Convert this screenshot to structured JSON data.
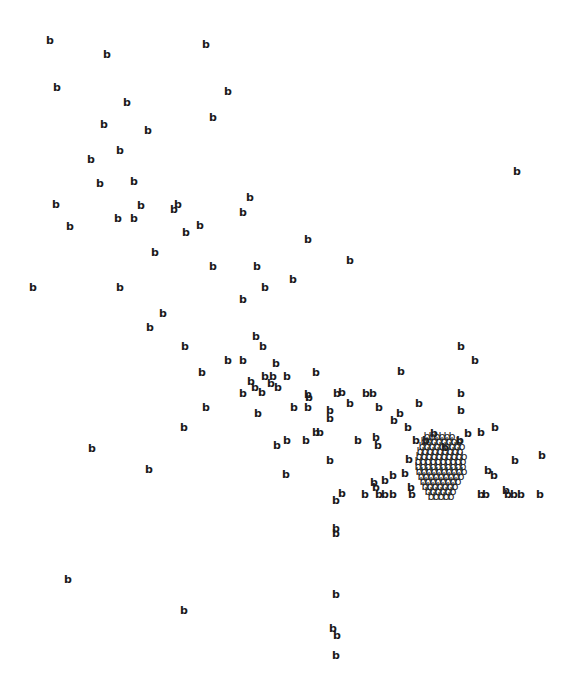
{
  "chart_data": {
    "type": "scatter",
    "marker_glyph": "b",
    "xlabel": "",
    "ylabel": "",
    "axes_visible": false,
    "grid": false,
    "legend": null,
    "coordinate_space": "pixel coordinates of a 571x687 image, origin top-left",
    "points": [
      [
        50,
        40
      ],
      [
        107,
        54
      ],
      [
        206,
        44
      ],
      [
        57,
        87
      ],
      [
        127,
        102
      ],
      [
        228,
        91
      ],
      [
        104,
        124
      ],
      [
        148,
        130
      ],
      [
        213,
        117
      ],
      [
        91,
        159
      ],
      [
        120,
        150
      ],
      [
        100,
        183
      ],
      [
        134,
        181
      ],
      [
        517,
        171
      ],
      [
        56,
        204
      ],
      [
        70,
        226
      ],
      [
        118,
        218
      ],
      [
        134,
        218
      ],
      [
        141,
        205
      ],
      [
        174,
        209
      ],
      [
        178,
        204
      ],
      [
        186,
        232
      ],
      [
        200,
        225
      ],
      [
        243,
        212
      ],
      [
        250,
        197
      ],
      [
        155,
        252
      ],
      [
        213,
        266
      ],
      [
        257,
        266
      ],
      [
        293,
        279
      ],
      [
        308,
        239
      ],
      [
        350,
        260
      ],
      [
        33,
        287
      ],
      [
        120,
        287
      ],
      [
        243,
        299
      ],
      [
        265,
        287
      ],
      [
        150,
        327
      ],
      [
        163,
        313
      ],
      [
        256,
        336
      ],
      [
        263,
        346
      ],
      [
        185,
        346
      ],
      [
        202,
        372
      ],
      [
        228,
        360
      ],
      [
        243,
        360
      ],
      [
        276,
        363
      ],
      [
        287,
        376
      ],
      [
        316,
        372
      ],
      [
        251,
        381
      ],
      [
        255,
        387
      ],
      [
        265,
        376
      ],
      [
        271,
        383
      ],
      [
        273,
        376
      ],
      [
        278,
        387
      ],
      [
        262,
        392
      ],
      [
        243,
        393
      ],
      [
        308,
        394
      ],
      [
        309,
        397
      ],
      [
        337,
        393
      ],
      [
        342,
        392
      ],
      [
        366,
        393
      ],
      [
        373,
        393
      ],
      [
        401,
        371
      ],
      [
        461,
        346
      ],
      [
        475,
        360
      ],
      [
        461,
        393
      ],
      [
        206,
        407
      ],
      [
        258,
        413
      ],
      [
        294,
        407
      ],
      [
        308,
        407
      ],
      [
        330,
        410
      ],
      [
        330,
        418
      ],
      [
        350,
        403
      ],
      [
        379,
        407
      ],
      [
        394,
        420
      ],
      [
        400,
        413
      ],
      [
        408,
        427
      ],
      [
        419,
        403
      ],
      [
        434,
        433
      ],
      [
        461,
        410
      ],
      [
        184,
        427
      ],
      [
        287,
        440
      ],
      [
        277,
        445
      ],
      [
        306,
        440
      ],
      [
        316,
        432
      ],
      [
        320,
        432
      ],
      [
        358,
        440
      ],
      [
        376,
        437
      ],
      [
        378,
        445
      ],
      [
        416,
        440
      ],
      [
        426,
        440
      ],
      [
        445,
        447
      ],
      [
        460,
        440
      ],
      [
        468,
        433
      ],
      [
        481,
        432
      ],
      [
        495,
        427
      ],
      [
        92,
        448
      ],
      [
        149,
        469
      ],
      [
        330,
        460
      ],
      [
        286,
        474
      ],
      [
        409,
        459
      ],
      [
        515,
        460
      ],
      [
        542,
        455
      ],
      [
        374,
        482
      ],
      [
        376,
        487
      ],
      [
        385,
        480
      ],
      [
        393,
        475
      ],
      [
        405,
        473
      ],
      [
        411,
        487
      ],
      [
        488,
        470
      ],
      [
        494,
        475
      ],
      [
        342,
        493
      ],
      [
        336,
        500
      ],
      [
        365,
        494
      ],
      [
        379,
        494
      ],
      [
        385,
        494
      ],
      [
        393,
        494
      ],
      [
        412,
        494
      ],
      [
        481,
        494
      ],
      [
        486,
        494
      ],
      [
        506,
        490
      ],
      [
        508,
        494
      ],
      [
        514,
        494
      ],
      [
        521,
        494
      ],
      [
        540,
        494
      ],
      [
        336,
        528
      ],
      [
        336,
        533
      ],
      [
        184,
        610
      ],
      [
        68,
        579
      ],
      [
        336,
        594
      ],
      [
        333,
        628
      ],
      [
        337,
        635
      ],
      [
        336,
        655
      ]
    ],
    "dense_cluster": {
      "approx_bounds": {
        "x": [
          418,
          466
        ],
        "y": [
          436,
          496
        ]
      },
      "approx_point_count": "representative",
      "note": "Heavily overplotted region; individual markers indistinguishable and not counted. Only bounds and density are conveyed."
    }
  },
  "labels": {
    "title": "·········"
  }
}
